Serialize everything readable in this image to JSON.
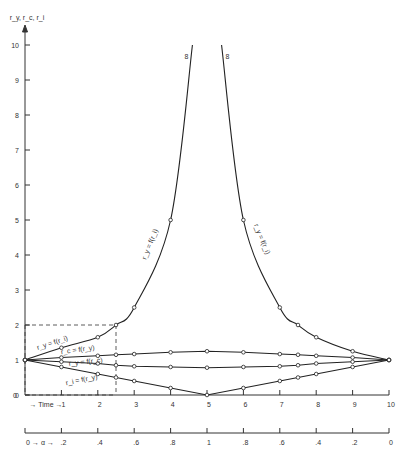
{
  "chart_data": {
    "type": "line",
    "title": "",
    "ylabel": "r_y, r_c, r_i",
    "xlabel": "Time",
    "secondary_xlabel": "α",
    "ylim": [
      0,
      10
    ],
    "xlim": [
      0,
      10
    ],
    "y_ticks": [
      "0",
      "1",
      "2",
      "3",
      "4",
      "5",
      "6",
      "7",
      "8",
      "9",
      "10"
    ],
    "x_ticks": [
      "1",
      "2",
      "3",
      "4",
      "5",
      "6",
      "7",
      "8",
      "9",
      "10"
    ],
    "alpha_ticks": [
      "0",
      ".2",
      ".4",
      ".6",
      ".8",
      "1",
      ".8",
      ".6",
      ".4",
      ".2",
      "0"
    ],
    "grid": false,
    "asymptote_labels": [
      "8",
      "8"
    ],
    "series": [
      {
        "name": "r_y = f(r_i) (left)",
        "x": [
          0,
          1,
          2,
          2.5,
          3,
          4,
          4.6
        ],
        "values": [
          1,
          1.35,
          1.65,
          2,
          2.5,
          5,
          10
        ]
      },
      {
        "name": "r_y = f(r_i) (right)",
        "x": [
          5.4,
          6,
          7,
          7.5,
          8,
          9,
          10
        ],
        "values": [
          10,
          5,
          2.5,
          2,
          1.65,
          1.25,
          1
        ]
      },
      {
        "name": "r_c = f(r_y)",
        "x": [
          0,
          1,
          2,
          2.5,
          3,
          4,
          5,
          6,
          7,
          7.5,
          8,
          9,
          10
        ],
        "values": [
          1,
          1.07,
          1.12,
          1.15,
          1.17,
          1.22,
          1.25,
          1.22,
          1.17,
          1.15,
          1.12,
          1.07,
          1
        ]
      },
      {
        "name": "r_y = f(r_c)",
        "x": [
          0,
          1,
          2,
          2.5,
          3,
          4,
          5,
          6,
          7,
          7.5,
          8,
          9,
          10
        ],
        "values": [
          1,
          0.95,
          0.9,
          0.85,
          0.82,
          0.8,
          0.78,
          0.8,
          0.82,
          0.85,
          0.9,
          0.95,
          1
        ]
      },
      {
        "name": "r_i = f(r_y)",
        "x": [
          0,
          1,
          2,
          2.5,
          3,
          4,
          5,
          6,
          7,
          7.5,
          8,
          9,
          10
        ],
        "values": [
          1,
          0.8,
          0.6,
          0.5,
          0.4,
          0.2,
          0,
          0.2,
          0.4,
          0.5,
          0.6,
          0.8,
          1
        ]
      }
    ],
    "annotations": [
      {
        "text": "dashed box at time 2.5, value 2",
        "x": 2.5,
        "y": 2
      }
    ]
  },
  "labels": {
    "y_axis_title": "r_y, r_c, r_i",
    "time_label": "→ Time →",
    "alpha_label": "0 →  α  →",
    "curve_left_upper": "r_y = f(r_i)",
    "curve_right_upper": "r_y = f(r_i)",
    "curve_rc": "r_c = f(r_y)",
    "curve_ry_low": "r_y = f(r_c)",
    "curve_ri": "r_i = f(r_y)",
    "curve_ry_small": "r_y = f(r_i)",
    "asym_left": "8",
    "asym_right": "8"
  }
}
